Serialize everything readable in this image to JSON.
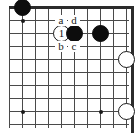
{
  "diagram": {
    "kind": "go-board-diagram",
    "board": {
      "columns": 10,
      "rows": 10,
      "cell_size": 13,
      "origin_x": 9,
      "origin_y": 7,
      "edges_shown": [
        "top",
        "right"
      ],
      "line_color": "#4a4a4a",
      "edge_color": "#2b2b2b",
      "background_color": "#ffffff"
    },
    "star_points": [
      {
        "name": "hoshi-upper-left",
        "col": 2,
        "row": 2
      },
      {
        "name": "hoshi-lower-left",
        "col": 2,
        "row": 9
      },
      {
        "name": "hoshi-lower-right",
        "col": 8,
        "row": 9
      }
    ],
    "stones": [
      {
        "name": "black-stone-upper-left",
        "color": "black",
        "col": 2,
        "row": 1,
        "label": ""
      },
      {
        "name": "white-stone-move-1",
        "color": "white",
        "col": 5,
        "row": 3,
        "label": "1"
      },
      {
        "name": "black-stone-center",
        "color": "black",
        "col": 6,
        "row": 3,
        "label": ""
      },
      {
        "name": "black-stone-right",
        "color": "black",
        "col": 8,
        "row": 3,
        "label": ""
      },
      {
        "name": "white-stone-right",
        "color": "white",
        "col": 10,
        "row": 5,
        "label": ""
      },
      {
        "name": "white-stone-lower-right",
        "color": "white",
        "col": 10,
        "row": 9,
        "label": ""
      }
    ],
    "point_labels": [
      {
        "name": "point-label-a",
        "text": "a",
        "col": 5,
        "row": 2
      },
      {
        "name": "point-label-d",
        "text": "d",
        "col": 6,
        "row": 2
      },
      {
        "name": "point-label-b",
        "text": "b",
        "col": 5,
        "row": 4
      },
      {
        "name": "point-label-c",
        "text": "c",
        "col": 6,
        "row": 4
      }
    ]
  }
}
